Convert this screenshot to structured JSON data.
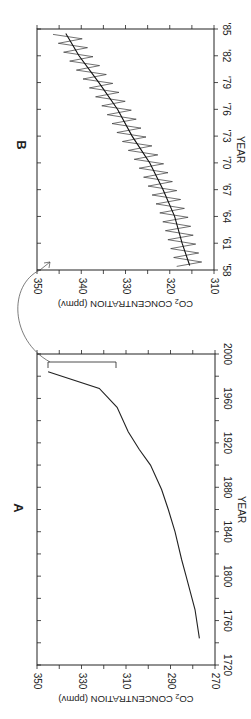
{
  "chart_data": [
    {
      "panel": "A",
      "type": "line",
      "title": "A",
      "xlabel": "YEAR",
      "ylabel": "CO2 CONCENTRATION (ppmv)",
      "xlim": [
        1720,
        2000
      ],
      "ylim": [
        270,
        350
      ],
      "xticks": [
        1720,
        1760,
        1800,
        1840,
        1880,
        1920,
        1960,
        2000
      ],
      "yticks": [
        270,
        290,
        310,
        330,
        350
      ],
      "grid": false,
      "x": [
        1744,
        1770,
        1800,
        1815,
        1840,
        1860,
        1878,
        1900,
        1914,
        1930,
        1952,
        1969,
        1984
      ],
      "values": [
        277,
        279,
        283,
        285,
        288,
        291,
        294,
        299,
        304,
        309,
        314,
        322,
        345
      ],
      "annotations": [
        "bracket marking 1958-1985 range (~315-345 ppmv) expanded in panel B"
      ]
    },
    {
      "panel": "B",
      "type": "line",
      "title": "B",
      "xlabel": "YEAR",
      "ylabel": "CO2 CONCENTRATION (ppmv)",
      "xlim": [
        1958,
        1985
      ],
      "ylim": [
        310,
        350
      ],
      "xticks": [
        "'58",
        "'61",
        "'64",
        "'67",
        "'70",
        "'73",
        "'76",
        "'79",
        "'82",
        "'85"
      ],
      "yticks": [
        310,
        320,
        330,
        340,
        350
      ],
      "grid": false,
      "series": [
        {
          "name": "annual trend",
          "x": [
            1958.5,
            1961,
            1964,
            1967,
            1970,
            1973,
            1976,
            1979,
            1982,
            1984.5
          ],
          "values": [
            315.5,
            317.2,
            318.9,
            321.5,
            324.5,
            328.5,
            331.8,
            336.0,
            340.5,
            343.5
          ]
        },
        {
          "name": "seasonal cycle",
          "amplitude_ppmv": 3,
          "description": "monthly zig-zag oscillating around trend"
        }
      ]
    }
  ],
  "labels": {
    "panel_a": "A",
    "panel_b": "B",
    "year": "YEAR",
    "ylabel_main": "CO",
    "ylabel_sub": "2",
    "ylabel_rest": " CONCENTRATION (ppmv)"
  }
}
